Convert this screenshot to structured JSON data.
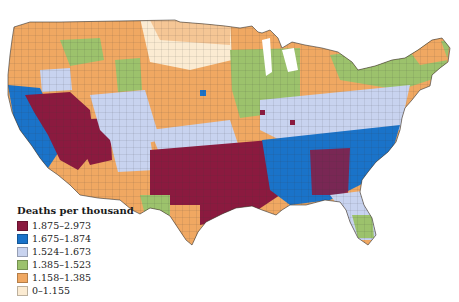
{
  "legend": {
    "title": "Deaths per thousand",
    "items": [
      {
        "label": "1.875–2.973",
        "color": "#8b1a3f"
      },
      {
        "label": "1.675–1.874",
        "color": "#1a73c9"
      },
      {
        "label": "1.524–1.673",
        "color": "#c8d3ef"
      },
      {
        "label": "1.385–1.523",
        "color": "#9cc26c"
      },
      {
        "label": "1.158–1.385",
        "color": "#f0a862"
      },
      {
        "label": "0–1.155",
        "color": "#fbebd2"
      }
    ]
  },
  "map": {
    "subject": "United States counties",
    "regions": [
      {
        "name": "pacific-northwest",
        "class": "1.158–1.385"
      },
      {
        "name": "california-coast",
        "class": "1.675–1.874"
      },
      {
        "name": "nevada-arizona-southwest",
        "class": "1.875–2.973"
      },
      {
        "name": "mountain-west",
        "class": "1.524–1.673"
      },
      {
        "name": "great-plains-north",
        "class": "0–1.155"
      },
      {
        "name": "midwest-plains",
        "class": "1.158–1.385"
      },
      {
        "name": "upper-midwest-michigan",
        "class": "1.385–1.523"
      },
      {
        "name": "ohio-valley-mid-atlantic",
        "class": "1.524–1.673"
      },
      {
        "name": "south-central",
        "class": "1.875–2.973"
      },
      {
        "name": "southeast",
        "class": "1.675–1.874"
      },
      {
        "name": "florida-gulf",
        "class": "1.524–1.673"
      },
      {
        "name": "south-texas",
        "class": "1.158–1.385"
      },
      {
        "name": "new-england",
        "class": "1.385–1.523"
      }
    ]
  }
}
